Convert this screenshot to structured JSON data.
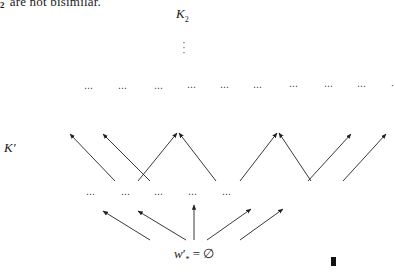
{
  "page": {
    "top_text_subscript": "2",
    "top_text": "are not bisimilar."
  },
  "diagram": {
    "top_label": {
      "main": "K",
      "sub": "2"
    },
    "vdots": "⋮",
    "upper_row_dots": [
      "⋯",
      "⋯",
      "⋯",
      "⋯",
      "⋯",
      "⋯",
      "⋯",
      "⋯",
      "⋯",
      "·"
    ],
    "side_label": {
      "main": "K",
      "prime": "′"
    },
    "middle_row_dots": [
      "⋯",
      "⋯",
      "⋯",
      "⋯",
      "⋯"
    ],
    "root_formula": {
      "var": "w",
      "prime": "′",
      "sub": "*",
      "equals": "=",
      "value": "∅"
    },
    "qed_symbol": "end-of-proof-box",
    "upper_arrows": [
      {
        "from": [
          115,
          181
        ],
        "to": [
          70,
          134
        ]
      },
      {
        "from": [
          150,
          181
        ],
        "to": [
          103,
          134
        ]
      },
      {
        "from": [
          138,
          181
        ],
        "to": [
          177,
          133
        ]
      },
      {
        "from": [
          216,
          181
        ],
        "to": [
          179,
          133
        ]
      },
      {
        "from": [
          240,
          181
        ],
        "to": [
          277,
          133
        ]
      },
      {
        "from": [
          311,
          181
        ],
        "to": [
          279,
          133
        ]
      },
      {
        "from": [
          308,
          181
        ],
        "to": [
          351,
          134
        ]
      },
      {
        "from": [
          343,
          181
        ],
        "to": [
          386,
          134
        ]
      }
    ],
    "lower_arrows": [
      {
        "from": [
          150,
          240
        ],
        "to": [
          103,
          211
        ]
      },
      {
        "from": [
          186,
          240
        ],
        "to": [
          138,
          211
        ]
      },
      {
        "from": [
          194,
          240
        ],
        "to": [
          194,
          205
        ]
      },
      {
        "from": [
          207,
          240
        ],
        "to": [
          251,
          209
        ]
      },
      {
        "from": [
          240,
          240
        ],
        "to": [
          283,
          209
        ]
      }
    ],
    "line_color": "#222222"
  }
}
